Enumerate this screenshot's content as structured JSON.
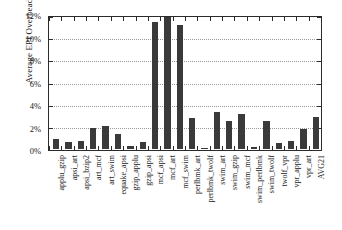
{
  "chart_data": {
    "type": "bar",
    "title": "",
    "xlabel": "",
    "ylabel": "Average EPI Overhead",
    "ylim": [
      0,
      12
    ],
    "yticks": [
      0,
      2,
      4,
      6,
      8,
      10,
      12
    ],
    "ytick_labels": [
      "0%",
      "2%",
      "4%",
      "6%",
      "8%",
      "10%",
      "12%"
    ],
    "grid": true,
    "legend": "none",
    "bar_color": "#3a3a3a",
    "units": "percent",
    "categories": [
      "applu_gzip",
      "apsi_art",
      "apsi_bzip2",
      "art_mcf",
      "art_swim",
      "equake_apsi",
      "gzip_applu",
      "gzip_apsi",
      "mcf_apsi",
      "mcf_art",
      "mcf_swim",
      "perlbmk_art",
      "perlbmk_twolf",
      "swim_art",
      "swim_gzip",
      "swim_mcf",
      "swim_perlbmk",
      "swim_twolf",
      "twolf_vpr",
      "vpr_applu",
      "vpr_art",
      "AVG21"
    ],
    "values": [
      0.9,
      0.65,
      0.7,
      1.9,
      2.1,
      1.35,
      0.3,
      0.6,
      11.5,
      11.9,
      11.2,
      2.8,
      0.05,
      3.35,
      2.55,
      3.2,
      0.15,
      2.55,
      0.55,
      0.75,
      1.85,
      2.9
    ]
  }
}
